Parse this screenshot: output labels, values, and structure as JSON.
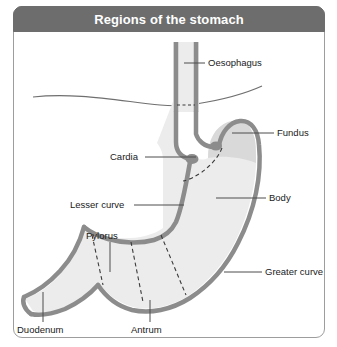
{
  "figure": {
    "title": "Regions of the stomach",
    "panel_border_color": "#9d9d9d",
    "title_bar_color": "#6d6d6d",
    "title_text_color": "#ffffff",
    "wall_color": "#8c8c8c",
    "lumen_fill_color": "#ececec",
    "fundus_fill_color": "#d9d9d9",
    "leader_line_color": "#4d4d4d",
    "dashed_line_color": "#3a3a3a",
    "background_color": "#ffffff"
  },
  "labels": {
    "oesophagus": "Oesophagus",
    "fundus": "Fundus",
    "cardia": "Cardia",
    "body": "Body",
    "lesser_curve": "Lesser curve",
    "greater_curve": "Greater curve",
    "pylorus": "Pylorus",
    "antrum": "Antrum",
    "duodenum": "Duodenum"
  },
  "diagram_data": {
    "type": "anatomical-diagram",
    "subject": "stomach",
    "regions": [
      "Oesophagus",
      "Cardia",
      "Fundus",
      "Body",
      "Antrum",
      "Pylorus",
      "Duodenum"
    ],
    "curvatures": [
      "Lesser curve",
      "Greater curve"
    ],
    "annotation_count": 9
  }
}
